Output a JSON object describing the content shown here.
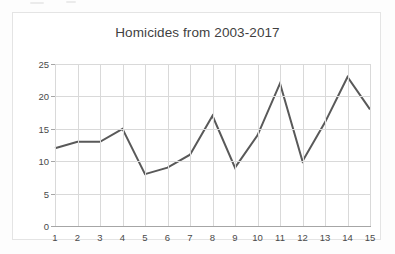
{
  "chart_data": {
    "type": "line",
    "title": "Homicides from 2003-2017",
    "xlabel": "",
    "ylabel": "",
    "categories": [
      "1",
      "2",
      "3",
      "4",
      "5",
      "6",
      "7",
      "8",
      "9",
      "10",
      "11",
      "12",
      "13",
      "14",
      "15"
    ],
    "x": [
      1,
      2,
      3,
      4,
      5,
      6,
      7,
      8,
      9,
      10,
      11,
      12,
      13,
      14,
      15
    ],
    "values": [
      12,
      13,
      13,
      15,
      8,
      9,
      11,
      17,
      9,
      14,
      22,
      10,
      16,
      23,
      18
    ],
    "series": [
      {
        "name": "Homicides",
        "values": [
          12,
          13,
          13,
          15,
          8,
          9,
          11,
          17,
          9,
          14,
          22,
          10,
          16,
          23,
          18
        ]
      }
    ],
    "ylim": [
      0,
      25
    ],
    "xlim": [
      1,
      15
    ],
    "yticks": [
      0,
      5,
      10,
      15,
      20,
      25
    ],
    "ytick_labels": [
      "0",
      "5",
      "10",
      "15",
      "20",
      "25"
    ],
    "xtick_labels": [
      "1",
      "2",
      "3",
      "4",
      "5",
      "6",
      "7",
      "8",
      "9",
      "10",
      "11",
      "12",
      "13",
      "14",
      "15"
    ],
    "grid": true,
    "legend": false,
    "legend_position": "none",
    "line_color": "#595959",
    "grid_color": "#d9d9d9",
    "axis_color": "#a6a6a6",
    "text_color": "#4a4a4a",
    "background_color": "#ffffff",
    "markers": false,
    "line_width": 2
  }
}
